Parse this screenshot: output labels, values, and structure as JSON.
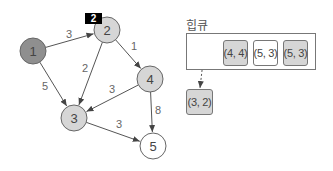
{
  "graph": {
    "nodes": [
      {
        "id": "1",
        "label": "1",
        "x": 33,
        "y": 51,
        "fill": "#8f8f8f"
      },
      {
        "id": "2",
        "label": "2",
        "x": 107,
        "y": 30,
        "fill": "#d6d6d6"
      },
      {
        "id": "3",
        "label": "3",
        "x": 74,
        "y": 118,
        "fill": "#d6d6d6"
      },
      {
        "id": "4",
        "label": "4",
        "x": 150,
        "y": 79,
        "fill": "#d6d6d6"
      },
      {
        "id": "5",
        "label": "5",
        "x": 153,
        "y": 146,
        "fill": "#ffffff"
      }
    ],
    "edges": [
      {
        "from": "1",
        "to": "2",
        "weight": "3"
      },
      {
        "from": "1",
        "to": "3",
        "weight": "5"
      },
      {
        "from": "2",
        "to": "3",
        "weight": "2"
      },
      {
        "from": "2",
        "to": "4",
        "weight": "1"
      },
      {
        "from": "4",
        "to": "3",
        "weight": "3"
      },
      {
        "from": "4",
        "to": "5",
        "weight": "8"
      },
      {
        "from": "3",
        "to": "5",
        "weight": "3"
      }
    ],
    "distance_tag": {
      "node": "2",
      "value": "2"
    }
  },
  "heap": {
    "title": "힙큐",
    "items": [
      {
        "label": "(4, 4)",
        "style": "gray"
      },
      {
        "label": "(5, 3)",
        "style": "white"
      },
      {
        "label": "(5, 3)",
        "style": "gray"
      }
    ],
    "popped": {
      "label": "(3, 2)",
      "style": "gray"
    }
  },
  "colors": {
    "visited": "#8f8f8f",
    "in_queue": "#d6d6d6",
    "unvisited": "#ffffff",
    "stroke": "#666666",
    "tag_bg": "#000000"
  }
}
